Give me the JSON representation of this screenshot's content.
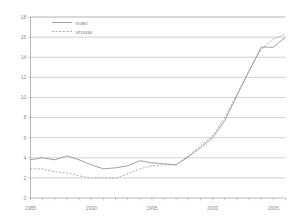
{
  "chart_data": {
    "type": "line",
    "title": "",
    "xlabel": "",
    "ylabel": "",
    "x": [
      1985,
      1986,
      1987,
      1988,
      1989,
      1990,
      1991,
      1992,
      1993,
      1994,
      1995,
      1996,
      1997,
      1998,
      1999,
      2000,
      2001,
      2002,
      2003,
      2004,
      2005,
      2006
    ],
    "series": [
      {
        "name": "man",
        "style": "solid",
        "color": "#8f8f8f",
        "values": [
          3.8,
          4.0,
          3.8,
          4.2,
          3.8,
          3.3,
          2.9,
          3.0,
          3.2,
          3.7,
          3.5,
          3.4,
          3.3,
          4.1,
          5.0,
          6.0,
          7.7,
          10.2,
          12.6,
          15.0,
          15.0,
          16.0
        ]
      },
      {
        "name": "vrouw",
        "style": "dashed",
        "color": "#9b9b9b",
        "values": [
          2.9,
          2.9,
          2.6,
          2.5,
          2.2,
          2.0,
          2.0,
          1.95,
          2.4,
          2.9,
          3.2,
          3.3,
          3.3,
          4.2,
          5.2,
          6.2,
          8.0,
          10.3,
          12.7,
          14.8,
          15.8,
          16.3
        ]
      }
    ],
    "xlim": [
      1985,
      2006
    ],
    "ylim": [
      0,
      18
    ],
    "ytick_step": 2,
    "yticks": [
      0,
      2,
      4,
      6,
      8,
      10,
      12,
      14,
      16,
      18
    ],
    "ytick_labels": [
      "0",
      "2",
      "4",
      "6",
      "8",
      "10",
      "12",
      "14",
      "16",
      "18"
    ],
    "xticks": [
      1985,
      1990,
      1995,
      2000,
      2005
    ],
    "xtick_labels": [
      "1985",
      "1990",
      "1995",
      "2000",
      "2005"
    ],
    "grid": "horizontal",
    "legend_position": "top-left",
    "legend_entries": [
      "man",
      "vrouw"
    ]
  },
  "legend": {
    "man_label": "man",
    "vrouw_label": "vrouw"
  },
  "colors": {
    "grid": "#b9b9b9",
    "axis": "#9a9a9a",
    "text": "#8c8c8c",
    "background": "#ffffff"
  }
}
